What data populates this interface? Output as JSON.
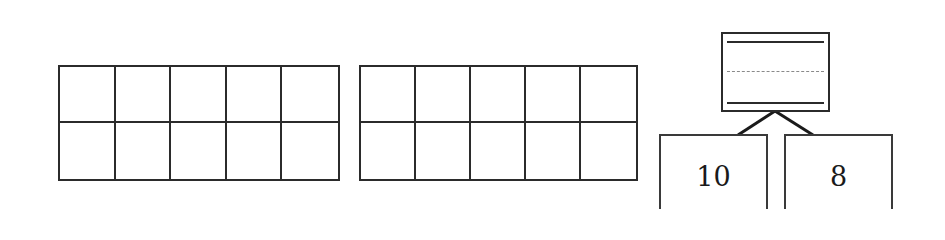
{
  "ten_frames": [
    {
      "id": "ten-frame-1",
      "rows": 2,
      "columns": 5,
      "filled": 0
    },
    {
      "id": "ten-frame-2",
      "rows": 2,
      "columns": 5,
      "filled": 0
    }
  ],
  "number_bond": {
    "whole": {
      "value": "",
      "lines": [
        "solid",
        "dashed",
        "solid"
      ]
    },
    "parts": [
      {
        "label": "10"
      },
      {
        "label": "8"
      }
    ]
  },
  "colors": {
    "line": "#2b2b2b",
    "dashed_guide": "#8a8a8a",
    "background": "#ffffff"
  }
}
